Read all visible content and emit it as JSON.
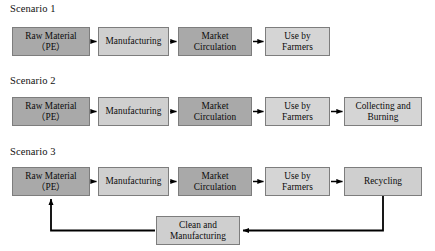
{
  "figure": {
    "kind": "process-flow-diagram"
  },
  "colors": {
    "box_dark": "#a9a9a9",
    "box_mid": "#bdbdbd",
    "box_light": "#cfcfcf",
    "box_pale": "#d5d5d5",
    "box_border": "#7d7d7d",
    "arrow": "#000000",
    "text": "#0b0b0b",
    "background": "#ffffff"
  },
  "scenarios": [
    {
      "label": "Scenario 1",
      "nodes": [
        {
          "text": "Raw Material\n（PE）",
          "tone": "tone-dark"
        },
        {
          "text": "Manufacturing",
          "tone": "tone-light"
        },
        {
          "text": "Market\nCirculation",
          "tone": "tone-dark"
        },
        {
          "text": "Use by\nFarmers",
          "tone": "tone-pale"
        }
      ]
    },
    {
      "label": "Scenario 2",
      "nodes": [
        {
          "text": "Raw Material\n（PE）",
          "tone": "tone-dark"
        },
        {
          "text": "Manufacturing",
          "tone": "tone-light"
        },
        {
          "text": "Market\nCirculation",
          "tone": "tone-dark"
        },
        {
          "text": "Use by\nFarmers",
          "tone": "tone-pale"
        },
        {
          "text": "Collecting and\nBurning",
          "tone": "tone-pale"
        }
      ]
    },
    {
      "label": "Scenario 3",
      "nodes": [
        {
          "text": "Raw Material\n（PE）",
          "tone": "tone-dark"
        },
        {
          "text": "Manufacturing",
          "tone": "tone-light"
        },
        {
          "text": "Market\nCirculation",
          "tone": "tone-dark"
        },
        {
          "text": "Use by\nFarmers",
          "tone": "tone-pale"
        },
        {
          "text": "Recycling",
          "tone": "tone-light"
        }
      ],
      "loop_node": {
        "text": "Clean and\nManufacturing",
        "tone": "tone-light"
      }
    }
  ]
}
